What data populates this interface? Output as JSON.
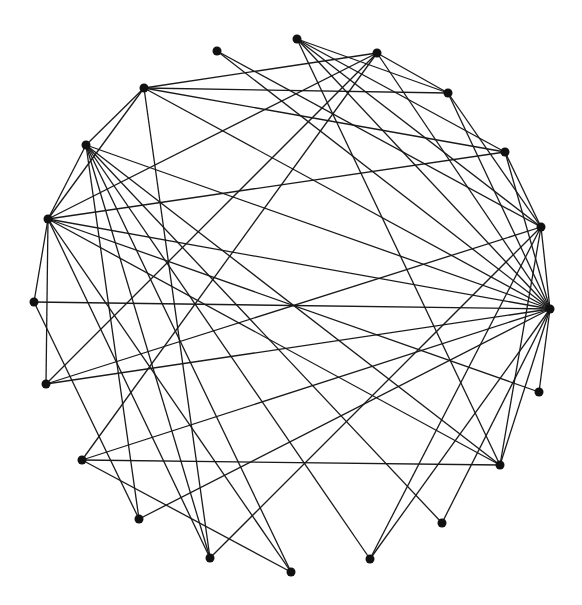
{
  "diagram": {
    "type": "circular-graph",
    "node_color": "#111111",
    "edge_color": "#1a1a1a",
    "node_radius": 4.5,
    "nodes": [
      {
        "id": "A",
        "x": 217,
        "y": 51
      },
      {
        "id": "B",
        "x": 297,
        "y": 39
      },
      {
        "id": "C",
        "x": 377,
        "y": 53
      },
      {
        "id": "D",
        "x": 448,
        "y": 93
      },
      {
        "id": "E",
        "x": 505,
        "y": 152
      },
      {
        "id": "F",
        "x": 541,
        "y": 227
      },
      {
        "id": "G",
        "x": 550,
        "y": 309
      },
      {
        "id": "H",
        "x": 539,
        "y": 392
      },
      {
        "id": "I",
        "x": 500,
        "y": 465
      },
      {
        "id": "J",
        "x": 442,
        "y": 523
      },
      {
        "id": "K",
        "x": 370,
        "y": 559
      },
      {
        "id": "L",
        "x": 291,
        "y": 572
      },
      {
        "id": "M",
        "x": 210,
        "y": 558
      },
      {
        "id": "N",
        "x": 139,
        "y": 519
      },
      {
        "id": "O",
        "x": 82,
        "y": 460
      },
      {
        "id": "P",
        "x": 46,
        "y": 384
      },
      {
        "id": "Q",
        "x": 34,
        "y": 302
      },
      {
        "id": "R",
        "x": 48,
        "y": 219
      },
      {
        "id": "S",
        "x": 86,
        "y": 145
      },
      {
        "id": "T",
        "x": 144,
        "y": 88
      }
    ],
    "edges": [
      [
        "T",
        "C"
      ],
      [
        "T",
        "D"
      ],
      [
        "T",
        "E"
      ],
      [
        "T",
        "G"
      ],
      [
        "T",
        "M"
      ],
      [
        "T",
        "S"
      ],
      [
        "T",
        "R"
      ],
      [
        "S",
        "R"
      ],
      [
        "S",
        "G"
      ],
      [
        "S",
        "I"
      ],
      [
        "S",
        "J"
      ],
      [
        "S",
        "K"
      ],
      [
        "S",
        "L"
      ],
      [
        "S",
        "M"
      ],
      [
        "S",
        "N"
      ],
      [
        "R",
        "Q"
      ],
      [
        "R",
        "P"
      ],
      [
        "R",
        "E"
      ],
      [
        "R",
        "G"
      ],
      [
        "R",
        "H"
      ],
      [
        "R",
        "I"
      ],
      [
        "R",
        "M"
      ],
      [
        "R",
        "L"
      ],
      [
        "R",
        "C"
      ],
      [
        "Q",
        "G"
      ],
      [
        "Q",
        "N"
      ],
      [
        "P",
        "C"
      ],
      [
        "P",
        "F"
      ],
      [
        "P",
        "G"
      ],
      [
        "O",
        "C"
      ],
      [
        "O",
        "G"
      ],
      [
        "O",
        "I"
      ],
      [
        "O",
        "L"
      ],
      [
        "N",
        "G"
      ],
      [
        "M",
        "F"
      ],
      [
        "K",
        "F"
      ],
      [
        "K",
        "G"
      ],
      [
        "J",
        "G"
      ],
      [
        "I",
        "G"
      ],
      [
        "I",
        "F"
      ],
      [
        "H",
        "G"
      ],
      [
        "A",
        "G"
      ],
      [
        "A",
        "F"
      ],
      [
        "B",
        "D"
      ],
      [
        "B",
        "E"
      ],
      [
        "B",
        "F"
      ],
      [
        "B",
        "G"
      ],
      [
        "B",
        "I"
      ],
      [
        "C",
        "D"
      ],
      [
        "C",
        "G"
      ],
      [
        "D",
        "F"
      ],
      [
        "D",
        "G"
      ],
      [
        "E",
        "F"
      ],
      [
        "E",
        "G"
      ],
      [
        "F",
        "G"
      ]
    ]
  }
}
